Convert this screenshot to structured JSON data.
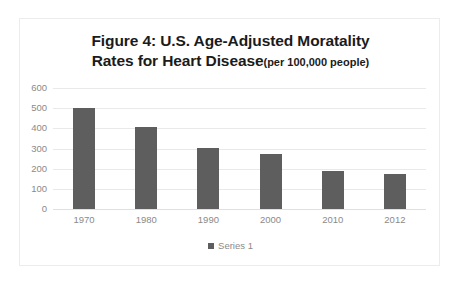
{
  "figure": {
    "title_line_1": "Figure 4:  U.S. Age-Adjusted Moratality",
    "title_line_2": "Rates for Heart Disease",
    "title_suffix": "(per 100,000 people)"
  },
  "colors": {
    "bar": "#5e5e5e",
    "gridline": "#e9e9e9",
    "tick_text": "#8a8a8a",
    "title_text": "#1b1b1b",
    "frame_border": "#ececec",
    "background": "#ffffff"
  },
  "legend": {
    "position": "bottom",
    "entries": [
      {
        "label": "Series 1",
        "color": "#5e5e5e"
      }
    ]
  },
  "chart_data": {
    "type": "bar",
    "xlabel": "",
    "ylabel": "",
    "categories": [
      "1970",
      "1980",
      "1990",
      "2000",
      "2010",
      "2012"
    ],
    "series": [
      {
        "name": "Series 1",
        "color": "#5e5e5e",
        "values": [
          500,
          405,
          305,
          275,
          190,
          172
        ]
      }
    ],
    "values": [
      500,
      405,
      305,
      275,
      190,
      172
    ],
    "ylim": [
      0,
      600
    ],
    "yticks": [
      0,
      100,
      200,
      300,
      400,
      500,
      600
    ],
    "ytick_labels": [
      "0",
      "100",
      "200",
      "300",
      "400",
      "500",
      "600"
    ],
    "grid": true,
    "grid_axis": "y",
    "legend_position": "bottom"
  }
}
